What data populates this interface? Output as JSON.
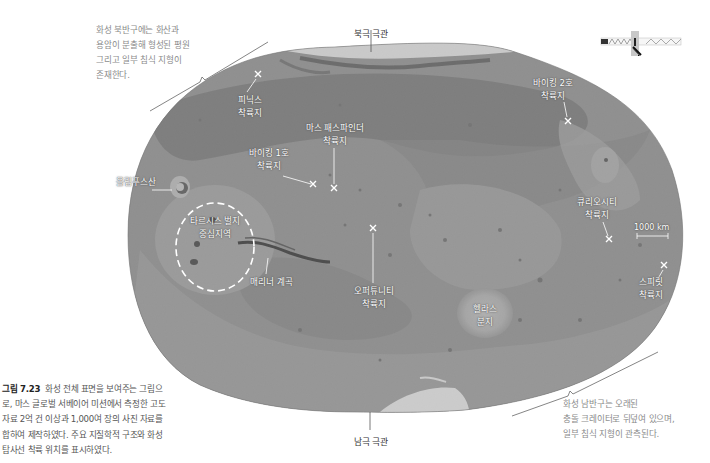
{
  "figure": {
    "caption_label": "그림 7.23",
    "caption_lines": [
      "화성 전체 표면을 보여주는 그림으",
      "로, 마스 글로벌 서베이어 미션에서 측정한 고도",
      "자료 2억 건 이상과 1,000여 장의 사진 자료를",
      "합하여 제작하였다. 주요 지질학적 구조와 화성",
      "탐사선 착륙 위치를 표시하였다."
    ]
  },
  "notes": {
    "northern": [
      "화성 북반구에는 화산과",
      "용암이 분출해 형성된 평원",
      "그리고 일부 침식 지형이",
      "존재한다."
    ],
    "southern": [
      "화성 남반구는 오래된",
      "충돌 크레이터로 뒤덮여 있으며,",
      "일부 침식 지형이 관측된다."
    ]
  },
  "poles": {
    "north": "북극 극관",
    "south": "남극 극관"
  },
  "landmarks": {
    "olympus": "올림푸스산",
    "tharsis": [
      "타르시스 벌지",
      "중심지역"
    ],
    "mariner": "매리너 계곡",
    "hellas": [
      "헬라스",
      "분지"
    ]
  },
  "landing_sites": [
    {
      "id": "phoenix",
      "lines": [
        "피닉스",
        "착륙지"
      ]
    },
    {
      "id": "viking1",
      "lines": [
        "바이킹 1호",
        "착륙지"
      ]
    },
    {
      "id": "pathfinder",
      "lines": [
        "마스 패스파인더",
        "착륙지"
      ]
    },
    {
      "id": "viking2",
      "lines": [
        "바이킹 2호",
        "착륙지"
      ]
    },
    {
      "id": "opportunity",
      "lines": [
        "오퍼튜니티",
        "착륙지"
      ]
    },
    {
      "id": "curiosity",
      "lines": [
        "큐리오시티",
        "착륙지"
      ]
    },
    {
      "id": "spirit",
      "lines": [
        "스피릿",
        "착륙지"
      ]
    }
  ],
  "scale_bar": "1000 km",
  "colors": {
    "map_base": "#9a9a9a",
    "ice": "#f4f4f4",
    "text_note": "#8a8a8a",
    "caption_bold": "#222222"
  }
}
